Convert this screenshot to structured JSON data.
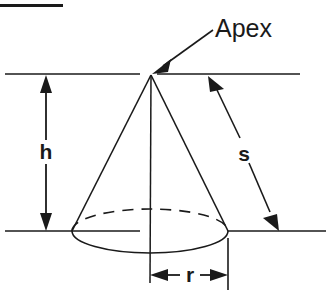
{
  "figure": {
    "title_rule": "",
    "labels": {
      "apex": "Apex",
      "height": "h",
      "slant": "s",
      "radius": "r"
    },
    "colors": {
      "ink": "#1a1a1a",
      "background": "#ffffff"
    },
    "geometry": {
      "apex_point": [
        151,
        75
      ],
      "base_center": [
        150,
        231
      ],
      "base_rx": 78,
      "base_ry": 22,
      "top_reference_line_y": 74,
      "bottom_reference_line_y": 231,
      "height_arrow_x": 46,
      "radius_arrow_y": 275
    },
    "elements": {
      "top_rule": "horizontal-rule",
      "cone": "cone-outline",
      "base_front_arc": "solid-arc",
      "base_back_arc": "dashed-arc",
      "axis": "vertical-axis-line",
      "apex_pointer": "arrow-to-apex",
      "height_dimension": "double-headed-vertical-arrow",
      "slant_dimension": "double-headed-diagonal-arrow",
      "radius_dimension": "double-headed-horizontal-arrow"
    }
  }
}
